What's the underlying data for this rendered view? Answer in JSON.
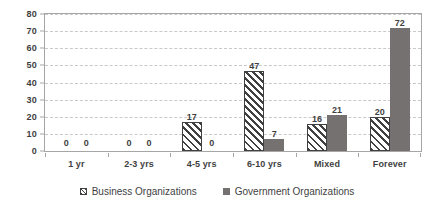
{
  "chart_data": {
    "type": "bar",
    "title": "",
    "subtitle": "",
    "xlabel": "",
    "ylabel": "",
    "categories": [
      "1 yr",
      "2-3 yrs",
      "4-5 yrs",
      "6-10 yrs",
      "Mixed",
      "Forever"
    ],
    "series": [
      {
        "name": "Business Organizations",
        "values": [
          0,
          0,
          17,
          47,
          16,
          20
        ],
        "style": "diagonal-hatch",
        "color": "#ffffff",
        "hatch_color": "#404040",
        "legend_marker": "hatched-square"
      },
      {
        "name": "Government Organizations",
        "values": [
          0,
          0,
          0,
          7,
          21,
          72
        ],
        "style": "solid",
        "color": "#767171",
        "legend_marker": "solid-square"
      }
    ],
    "ylim": [
      0,
      80
    ],
    "ytick_step": 10,
    "yticks": [
      "80",
      "70",
      "60",
      "50",
      "40",
      "30",
      "20",
      "10",
      "0"
    ],
    "grid": true,
    "grid_style": "dashed-horizontal",
    "grid_color": "#c9c9c9",
    "legend_position": "bottom-center",
    "data_labels": true,
    "axis_color": "#a6a6a6",
    "text_color": "#3f3f3f",
    "background": "#ffffff"
  }
}
